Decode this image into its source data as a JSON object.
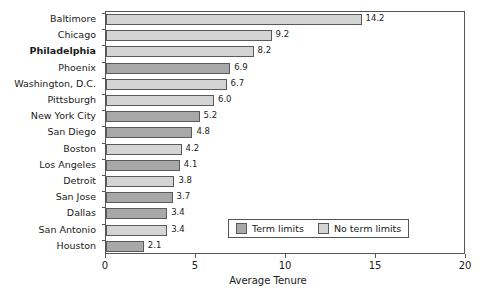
{
  "chart_data": {
    "type": "bar",
    "orientation": "horizontal",
    "title": "",
    "xlabel": "Average Tenure",
    "ylabel": "",
    "xlim": [
      0,
      20
    ],
    "xticks": [
      0,
      5,
      10,
      15,
      20
    ],
    "grid": false,
    "legend": {
      "position": "inside-bottom-right",
      "entries": [
        {
          "label": "Term limits",
          "color": "#a8a8a8",
          "key": "term"
        },
        {
          "label": "No term limits",
          "color": "#d4d4d4",
          "key": "noterm"
        }
      ]
    },
    "categories": [
      "Baltimore",
      "Chicago",
      "Philadelphia",
      "Phoenix",
      "Washington, D.C.",
      "Pittsburgh",
      "New York City",
      "San Diego",
      "Boston",
      "Los Angeles",
      "Detroit",
      "San Jose",
      "Dallas",
      "San Antonio",
      "Houston"
    ],
    "values": [
      14.2,
      9.2,
      8.2,
      6.9,
      6.7,
      6.0,
      5.2,
      4.8,
      4.2,
      4.1,
      3.8,
      3.7,
      3.4,
      3.4,
      2.1
    ],
    "value_labels": [
      "14.2",
      "9.2",
      "8.2",
      "6.9",
      "6.7",
      "6.0",
      "5.2",
      "4.8",
      "4.2",
      "4.1",
      "3.8",
      "3.7",
      "3.4",
      "3.4",
      "2.1"
    ],
    "groups": [
      "noterm",
      "noterm",
      "noterm",
      "term",
      "noterm",
      "noterm",
      "term",
      "term",
      "noterm",
      "term",
      "noterm",
      "term",
      "term",
      "noterm",
      "term"
    ],
    "emphasized_category": "Philadelphia",
    "points": [
      {
        "category": "Baltimore",
        "value": 14.2,
        "label": "14.2",
        "group": "noterm",
        "bold": false
      },
      {
        "category": "Chicago",
        "value": 9.2,
        "label": "9.2",
        "group": "noterm",
        "bold": false
      },
      {
        "category": "Philadelphia",
        "value": 8.2,
        "label": "8.2",
        "group": "noterm",
        "bold": true
      },
      {
        "category": "Phoenix",
        "value": 6.9,
        "label": "6.9",
        "group": "term",
        "bold": false
      },
      {
        "category": "Washington, D.C.",
        "value": 6.7,
        "label": "6.7",
        "group": "noterm",
        "bold": false
      },
      {
        "category": "Pittsburgh",
        "value": 6.0,
        "label": "6.0",
        "group": "noterm",
        "bold": false
      },
      {
        "category": "New York City",
        "value": 5.2,
        "label": "5.2",
        "group": "term",
        "bold": false
      },
      {
        "category": "San Diego",
        "value": 4.8,
        "label": "4.8",
        "group": "term",
        "bold": false
      },
      {
        "category": "Boston",
        "value": 4.2,
        "label": "4.2",
        "group": "noterm",
        "bold": false
      },
      {
        "category": "Los Angeles",
        "value": 4.1,
        "label": "4.1",
        "group": "term",
        "bold": false
      },
      {
        "category": "Detroit",
        "value": 3.8,
        "label": "3.8",
        "group": "noterm",
        "bold": false
      },
      {
        "category": "San Jose",
        "value": 3.7,
        "label": "3.7",
        "group": "term",
        "bold": false
      },
      {
        "category": "Dallas",
        "value": 3.4,
        "label": "3.4",
        "group": "term",
        "bold": false
      },
      {
        "category": "San Antonio",
        "value": 3.4,
        "label": "3.4",
        "group": "noterm",
        "bold": false
      },
      {
        "category": "Houston",
        "value": 2.1,
        "label": "2.1",
        "group": "term",
        "bold": false
      }
    ],
    "colors": {
      "term": "#a8a8a8",
      "noterm": "#d4d4d4",
      "bar_border": "#5a5a5a",
      "axis": "#555555",
      "text": "#1a1a1a",
      "background": "#ffffff"
    }
  }
}
